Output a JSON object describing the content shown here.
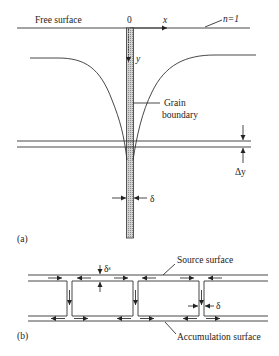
{
  "figure": {
    "part_a": {
      "panel_label": "(a)",
      "free_surface_label": "Free surface",
      "origin_label": "0",
      "x_axis_label": "x",
      "y_axis_label": "y",
      "contour_label": "n=1",
      "grain_boundary_label_line1": "Grain",
      "grain_boundary_label_line2": "boundary",
      "delta_y_label": "Δy",
      "delta_label": "δ"
    },
    "part_b": {
      "panel_label": "(b)",
      "source_surface_label": "Source surface",
      "accumulation_surface_label": "Accumulation surface",
      "delta_s_label": "δˢ",
      "delta_label": "δ"
    },
    "colors": {
      "line": "#333333",
      "hatch": "#9a9a9a",
      "text": "#222222",
      "background": "#ffffff"
    }
  }
}
